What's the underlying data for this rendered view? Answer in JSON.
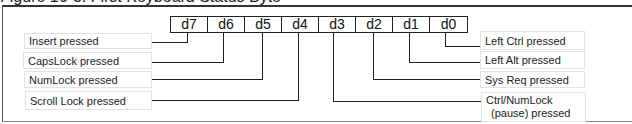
{
  "title": "Figure 16-3. First Keyboard Status Byte",
  "bits": [
    "d7",
    "d6",
    "d5",
    "d4",
    "d3",
    "d2",
    "d1",
    "d0"
  ],
  "left_labels": [
    {
      "bit": "d7",
      "text": "Insert pressed"
    },
    {
      "bit": "d6",
      "text": "CapsLock pressed"
    },
    {
      "bit": "d5",
      "text": "NumLock pressed"
    },
    {
      "bit": "d4",
      "text": "Scroll Lock pressed"
    }
  ],
  "right_labels": [
    {
      "bit": "d0",
      "text": "Left Ctrl pressed"
    },
    {
      "bit": "d1",
      "text": "Left Alt pressed"
    },
    {
      "bit": "d2",
      "text": "Sys Req pressed"
    },
    {
      "bit": "d3",
      "text_line1": "Ctrl/NumLock",
      "text_line2": "(pause) pressed"
    }
  ],
  "colors": {
    "line": "#222222",
    "label_border": "#e2e2e2",
    "background": "#ffffff"
  }
}
